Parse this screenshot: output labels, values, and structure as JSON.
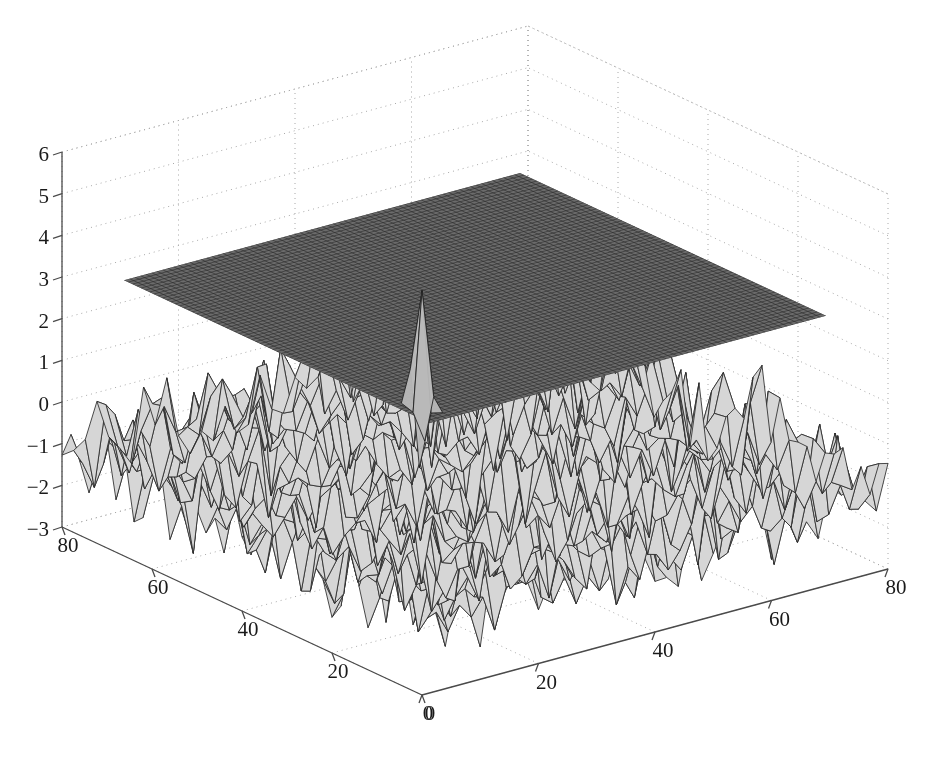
{
  "figure": {
    "kind": "matlab-3d-surface-figure",
    "width": 940,
    "height": 758,
    "background": "#ffffff",
    "title": "",
    "renderer": "mesh-wireframe"
  },
  "chart_data": {
    "type": "surface",
    "title": "",
    "subtitle": "",
    "xlabel": "",
    "ylabel": "",
    "zlabel": "",
    "grid": true,
    "legend": null,
    "legend_position": "none",
    "projection": "orthographic-3d",
    "view": {
      "azimuth": -37.5,
      "elevation": 30
    },
    "axes": {
      "x": {
        "label": "",
        "min": 0,
        "max": 80,
        "ticks": [
          0,
          20,
          40,
          60,
          80
        ],
        "tick_labels": [
          "0",
          "20",
          "40",
          "60",
          "80"
        ],
        "direction": "right-ascending"
      },
      "y": {
        "label": "",
        "min": 0,
        "max": 80,
        "ticks": [
          0,
          20,
          40,
          60,
          80
        ],
        "tick_labels": [
          "0",
          "20",
          "40",
          "60",
          "80"
        ],
        "direction": "left-ascending"
      },
      "z": {
        "label": "",
        "min": -3,
        "max": 6,
        "ticks": [
          -3,
          -2,
          -1,
          0,
          1,
          2,
          3,
          4,
          5,
          6
        ],
        "tick_labels": [
          "−3",
          "−2",
          "−1",
          "0",
          "1",
          "2",
          "3",
          "4",
          "5",
          "6"
        ]
      }
    },
    "series": [
      {
        "name": "noise-surface",
        "role": "data",
        "type": "mesh",
        "description": "Rough random noise surface spanning the full xy grid",
        "grid_size": 41,
        "z_mean": -1.0,
        "z_min": -3.0,
        "z_max": 3.2,
        "noise_amplitude": 1.0,
        "face_color": "#d6d6d6",
        "edge_color": "#2b2b2b",
        "peaks": [
          {
            "x": 34,
            "y": 44,
            "z": 3.1,
            "label": "tall-spike-left"
          },
          {
            "x": 44,
            "y": 40,
            "z": 3.2,
            "label": "tall-spike-right"
          },
          {
            "x": 52,
            "y": 38,
            "z": 2.4,
            "label": "medium-spike"
          },
          {
            "x": 40,
            "y": 34,
            "z": 1.9,
            "label": "minor-spike"
          }
        ]
      },
      {
        "name": "threshold-plane",
        "role": "reference",
        "type": "plane",
        "description": "Flat constant-z reference plane drawn as a dense dark mesh",
        "z_level": 3.0,
        "x_range": [
          6,
          74
        ],
        "y_range": [
          6,
          74
        ],
        "grid_size": 72,
        "face_color": "#6b6b6b",
        "edge_color": "#2a2a2a"
      }
    ],
    "colors": {
      "axis_line": "#4a4a4a",
      "grid_dot": "#a8a8a8",
      "tick_text": "#1a1a1a",
      "surface_face": "#d6d6d6",
      "surface_edge": "#2b2b2b",
      "plane_face": "#6b6b6b",
      "plane_edge": "#2a2a2a",
      "background": "#ffffff"
    }
  },
  "z_tick_labels": [
    "6",
    "5",
    "4",
    "3",
    "2",
    "1",
    "0",
    "−1",
    "−2",
    "−3"
  ],
  "y_tick_labels": [
    "80",
    "60",
    "40",
    "20",
    "0"
  ],
  "x_tick_labels": [
    "0",
    "20",
    "40",
    "60",
    "80"
  ]
}
